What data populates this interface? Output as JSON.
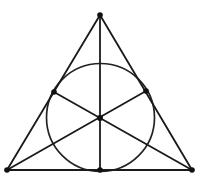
{
  "figure": {
    "background_color": "#ffffff",
    "stroke_color": "#1a1a1a",
    "circle_stroke_color": "#232323",
    "dot_color": "#111111",
    "canvas": {
      "width": 202,
      "height": 182
    }
  },
  "geometry": {
    "points": {
      "apex": {
        "label": "A",
        "x": 100,
        "y": 15
      },
      "bottom_left": {
        "label": "B",
        "x": 7,
        "y": 170
      },
      "bottom_right": {
        "label": "C",
        "x": 192,
        "y": 170
      },
      "midpoint_left": {
        "label": "M_AB",
        "x": 54,
        "y": 92
      },
      "midpoint_right": {
        "label": "M_AC",
        "x": 146,
        "y": 91
      },
      "midpoint_bottom": {
        "label": "M_BC",
        "x": 100,
        "y": 170
      },
      "centroid": {
        "label": "G",
        "x": 100,
        "y": 118
      }
    },
    "circle": {
      "label": "inscribed-circle",
      "cx": 100.5,
      "cy": 117.5,
      "r": 54
    },
    "triangle_sides": [
      {
        "name": "side-left",
        "from": "apex",
        "to": "bottom_left"
      },
      {
        "name": "side-right",
        "from": "apex",
        "to": "bottom_right"
      },
      {
        "name": "side-base",
        "from": "bottom_left",
        "to": "bottom_right"
      }
    ],
    "medians": [
      {
        "name": "median-from-apex",
        "from": "apex",
        "to": "midpoint_bottom"
      },
      {
        "name": "median-from-bottom-left",
        "from": "bottom_left",
        "to": "midpoint_right"
      },
      {
        "name": "median-from-bottom-right",
        "from": "bottom_right",
        "to": "midpoint_left"
      }
    ],
    "stroke_widths": {
      "triangle": 1.8,
      "median": 1.8,
      "circle": 1.7
    },
    "dot_radius": 2.6
  }
}
